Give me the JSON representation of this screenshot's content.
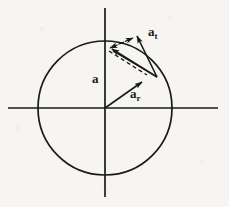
{
  "figure": {
    "background_color": "#f6f5f1",
    "ink_color": "#1a1a18"
  },
  "geometry": {
    "center": {
      "x": 105,
      "y": 108
    },
    "radius": 67,
    "point_on_circle": {
      "x": 157,
      "y": 77
    },
    "x_axis": {
      "x1": 8,
      "y1": 108,
      "x2": 218,
      "y2": 108
    },
    "y_axis": {
      "x1": 105,
      "y1": 8,
      "x2": 105,
      "y2": 197
    },
    "vector_a": {
      "x1": 157,
      "y1": 77,
      "x2": 111,
      "y2": 48
    },
    "vector_a_t": {
      "x1": 157,
      "y1": 77,
      "x2": 136,
      "y2": 35
    },
    "vector_a_r": {
      "x1": 105,
      "y1": 108,
      "x2": 143,
      "y2": 82
    },
    "dashed_a_to_tip": {
      "x1": 111,
      "y1": 48,
      "x2": 132,
      "y2": 38
    },
    "dashed_parallel_radial": {
      "x1": 110,
      "y1": 50,
      "x2": 148,
      "y2": 74
    }
  },
  "labels": {
    "total_acceleration": {
      "base": "a",
      "subscript": ""
    },
    "tangential_acceleration": {
      "base": "a",
      "subscript": "t"
    },
    "radial_acceleration": {
      "base": "a",
      "subscript": "r"
    }
  }
}
